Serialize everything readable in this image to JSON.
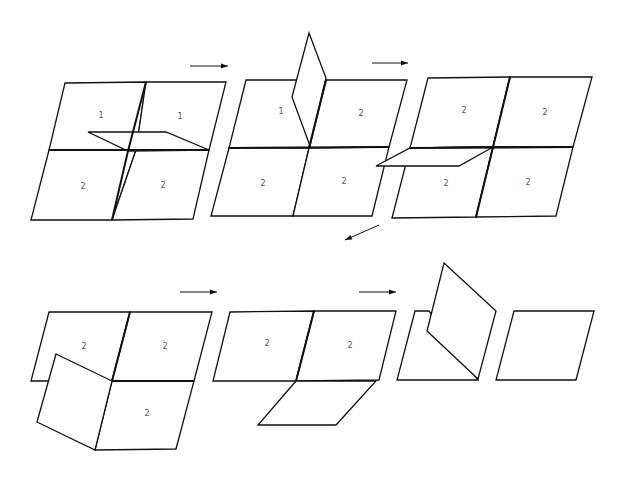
{
  "diagram": {
    "type": "folding-sequence",
    "colors": {
      "stroke": "#111111",
      "label": "#555555",
      "background": "#ffffff"
    },
    "steps": [
      {
        "id": 1,
        "panels": [
          {
            "label": "1",
            "points": "65,83 146,82 136,150 49,150",
            "lx": 101,
            "ly": 115
          },
          {
            "label": "1",
            "points": "146,82 226,82 209,150 136,150",
            "lx": 180,
            "ly": 116
          },
          {
            "label": "2",
            "points": "49,150 136,150 112,220 31,220",
            "lx": 83,
            "ly": 186
          },
          {
            "label": "2",
            "points": "136,150 209,150 193,219 112,220",
            "lx": 163,
            "ly": 185
          }
        ],
        "flaps": [
          {
            "points": "88,132 166,132 209,150 128,151"
          }
        ],
        "creases": [
          "146,82 128,151",
          "49,150 209,150",
          "128,151 112,220"
        ]
      },
      {
        "id": 2,
        "panels": [
          {
            "label": "1",
            "points": "246,80 326,80 309,148 229,148",
            "lx": 281,
            "ly": 111
          },
          {
            "label": "2",
            "points": "326,80 407,80 389,147 309,148",
            "lx": 361,
            "ly": 113
          },
          {
            "label": "2",
            "points": "229,148 309,148 293,216 211,216",
            "lx": 263,
            "ly": 183
          },
          {
            "label": "2",
            "points": "309,148 389,147 372,216 293,216",
            "lx": 344,
            "ly": 181
          }
        ],
        "flaps": [
          {
            "points": "309,33 326,78 310,146 292,97"
          }
        ],
        "creases": [
          "326,80 309,148",
          "229,148 389,147"
        ]
      },
      {
        "id": 3,
        "panels": [
          {
            "label": "2",
            "points": "428,78 510,77 493,147 410,148",
            "lx": 464,
            "ly": 110
          },
          {
            "label": "2",
            "points": "510,77 592,77 573,147 493,147",
            "lx": 545,
            "ly": 112
          },
          {
            "label": "2",
            "points": "410,148 493,147 476,217 392,218",
            "lx": 446,
            "ly": 183
          },
          {
            "label": "2",
            "points": "493,147 573,147 556,216 476,217",
            "lx": 528,
            "ly": 182
          }
        ],
        "flaps": [
          {
            "points": "410,148 493,147 459,166 376,166"
          }
        ],
        "creases": [
          "510,77 476,217",
          "410,148 573,147"
        ]
      },
      {
        "id": 4,
        "panels": [
          {
            "label": "2",
            "points": "49,312 130,312 112,381 31,381",
            "lx": 84,
            "ly": 346
          },
          {
            "label": "2",
            "points": "130,312 212,312 194,381 112,381",
            "lx": 165,
            "ly": 346
          },
          {
            "label": "2",
            "points": "112,381 194,381 176,449 95,450",
            "lx": 147,
            "ly": 413
          }
        ],
        "flaps": [
          {
            "points": "56,354 112,381 95,450 37,422"
          }
        ],
        "creases": [
          "130,312 112,381",
          "112,381 194,381"
        ]
      },
      {
        "id": 5,
        "panels": [
          {
            "label": "2",
            "points": "230,312 314,311 296,381 213,381",
            "lx": 267,
            "ly": 343
          },
          {
            "label": "2",
            "points": "314,311 396,311 379,380 296,381",
            "lx": 350,
            "ly": 345
          }
        ],
        "flaps": [
          {
            "points": "296,381 376,381 336,425 258,425"
          }
        ],
        "creases": [
          "314,311 296,381"
        ]
      },
      {
        "id": 6,
        "panels": [
          {
            "label": "",
            "points": "415,311 429,311 478,380 397,380",
            "lx": 0,
            "ly": 0
          },
          {
            "label": "",
            "points": "514,311 594,311 576,380 496,380",
            "lx": 0,
            "ly": 0
          }
        ],
        "flaps": [
          {
            "points": "444,263 496,311 478,379 427,331"
          }
        ],
        "creases": []
      }
    ],
    "arrows": [
      {
        "from": "190,66",
        "to": "228,66",
        "direction": "right"
      },
      {
        "from": "372,63",
        "to": "408,63",
        "direction": "right"
      },
      {
        "from": "379,225",
        "to": "345,240",
        "direction": "down-left"
      },
      {
        "from": "180,292",
        "to": "217,292",
        "direction": "right"
      },
      {
        "from": "359,292",
        "to": "396,292",
        "direction": "right"
      }
    ]
  }
}
